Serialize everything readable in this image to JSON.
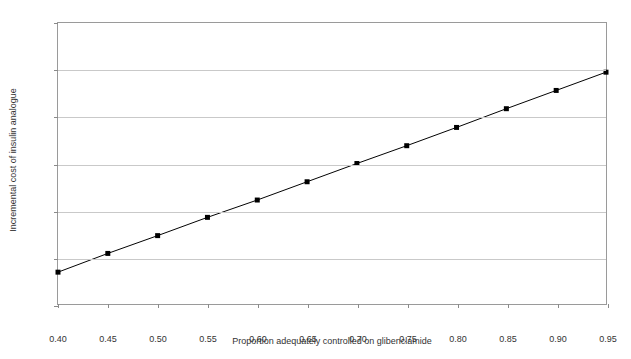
{
  "chart_data": {
    "type": "line",
    "title": "",
    "xlabel": "Proportion adequately controlled on glibenclamide",
    "ylabel": "Incremental cost of insulin analogue",
    "x": [
      0.4,
      0.45,
      0.5,
      0.55,
      0.6,
      0.65,
      0.7,
      0.75,
      0.8,
      0.85,
      0.9,
      0.95
    ],
    "values": [
      36.8,
      40.8,
      44.6,
      48.5,
      52.2,
      56.1,
      60.0,
      63.8,
      67.7,
      71.7,
      75.6,
      79.5
    ],
    "series": [
      {
        "name": "Incremental cost of insulin analogue",
        "values": [
          36.8,
          40.8,
          44.6,
          48.5,
          52.2,
          56.1,
          60.0,
          63.8,
          67.7,
          71.7,
          75.6,
          79.5
        ]
      }
    ],
    "xlim": [
      0.4,
      0.95
    ],
    "ylim": [
      30,
      90
    ],
    "xticks": [
      0.4,
      0.45,
      0.5,
      0.55,
      0.6,
      0.65,
      0.7,
      0.75,
      0.8,
      0.85,
      0.9,
      0.95
    ],
    "xtick_labels": [
      "0.40",
      "0.45",
      "0.50",
      "0.55",
      "0.60",
      "0.65",
      "0.70",
      "0.75",
      "0.80",
      "0.85",
      "0.90",
      "0.95"
    ],
    "yticks": [
      30,
      40,
      50,
      60,
      70,
      80,
      90
    ],
    "ytick_labels": [
      "£30",
      "£40",
      "£50",
      "£60",
      "£70",
      "£80",
      "£90"
    ],
    "grid": "horizontal",
    "legend": "none",
    "marker": "square",
    "marker_color": "#000000",
    "line_color": "#000000",
    "gridline_color": "#c9c9c9",
    "frame_color": "#9a9a9a",
    "background_color": "#ffffff",
    "currency_symbol": "£"
  }
}
